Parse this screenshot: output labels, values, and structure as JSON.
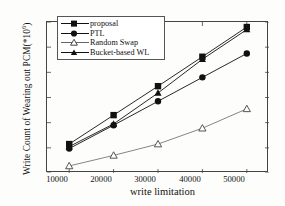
{
  "chart_data": {
    "type": "line",
    "title": "",
    "xlabel": "write limitation",
    "ylabel": "Write Count of Wearing out PCM(*10",
    "ylabel_exponent": "6",
    "ylabel_close": ")",
    "x": [
      10000,
      20000,
      30000,
      40000,
      50000
    ],
    "xticklabels": [
      "10000",
      "20000",
      "30000",
      "40000",
      "50000"
    ],
    "yticklabels": [
      "0",
      "100",
      "200",
      "300",
      "400",
      "500",
      "600"
    ],
    "yticks": [
      0,
      100,
      200,
      300,
      400,
      500,
      600
    ],
    "xlim": [
      5000,
      55000
    ],
    "ylim": [
      0,
      600
    ],
    "grid": false,
    "legend_position": "upper-left",
    "series": [
      {
        "name": "proposal",
        "marker": "filled-square",
        "values": [
          115,
          230,
          345,
          462,
          580
        ]
      },
      {
        "name": "PTL",
        "marker": "filled-circle",
        "values": [
          97,
          190,
          285,
          380,
          475
        ]
      },
      {
        "name": "Random Swap",
        "marker": "open-triangle",
        "values": [
          28,
          70,
          115,
          178,
          255
        ]
      },
      {
        "name": "Bucket-based WL",
        "marker": "filled-triangle",
        "values": [
          105,
          195,
          318,
          452,
          570
        ]
      }
    ]
  },
  "legend": {
    "items": [
      {
        "label": "proposal"
      },
      {
        "label": "PTL"
      },
      {
        "label": "Random Swap"
      },
      {
        "label": "Bucket-based WL"
      }
    ]
  }
}
